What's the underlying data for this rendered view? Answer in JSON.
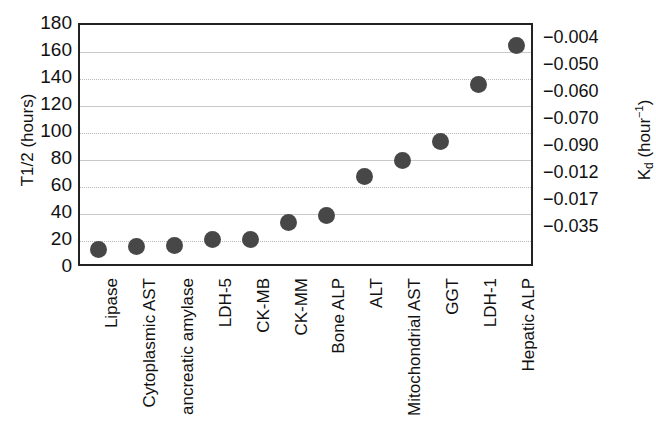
{
  "chart_data": {
    "type": "scatter",
    "title": "",
    "xlabel": "",
    "ylabel": "T1/2 (hours)",
    "ylabel_right": "Kd (hour-1)",
    "ylabel_right_base": "K",
    "ylabel_right_sub": "d",
    "ylabel_right_mid": " (hour",
    "ylabel_right_sup": "−1",
    "ylabel_right_end": ")",
    "categories": [
      "Lipase",
      "Cytoplasmic AST",
      "ancreatic amylase",
      "LDH-5",
      "CK-MB",
      "CK-MM",
      "Bone ALP",
      "ALT",
      "Mitochondrial AST",
      "GGT",
      "LDH-1",
      "Hepatic ALP"
    ],
    "values": [
      14,
      16,
      17,
      21,
      21,
      34,
      39,
      68,
      80,
      94,
      136,
      165
    ],
    "ylim": [
      0,
      180
    ],
    "yticks": [
      180,
      160,
      140,
      120,
      100,
      80,
      60,
      40,
      20,
      0
    ],
    "ytick_labels": [
      "180",
      "160",
      "140",
      "120",
      "100",
      "80",
      "60",
      "40",
      "20",
      "0"
    ],
    "grid": true,
    "gridlines_at": [
      160,
      140,
      120,
      100,
      80,
      60,
      40,
      20
    ],
    "right_axis_labels": [
      "−0.004",
      "−0.050",
      "−0.060",
      "−0.070",
      "−0.090",
      "−0.012",
      "−0.017",
      "−0.035"
    ],
    "right_axis_label_positions": [
      170,
      150,
      130,
      110,
      90,
      70,
      50,
      30
    ],
    "marker": "filled-circle",
    "marker_color": "#474747",
    "axis_color": "#222222",
    "grid_color": "#c9c9c9",
    "legend": "none"
  }
}
